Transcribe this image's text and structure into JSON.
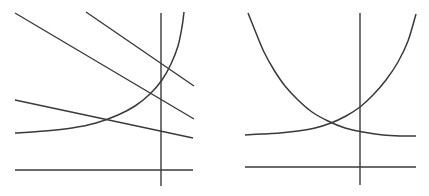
{
  "figure": {
    "title": "",
    "background_color": "#ffffff",
    "stroke_color": "#3a3a3a",
    "width": 429,
    "height": 196,
    "panel_count": 2
  },
  "chart_data": {
    "type": "line",
    "title": "",
    "subtitle": "",
    "xlabel": "",
    "ylabel": "",
    "grid": false,
    "legend": "none",
    "annotations": [],
    "panels": [
      {
        "name": "left-panel",
        "description": "Three downward-sloping straight lines crossed by a rising exponential curve, over an x-axis and a y-axis",
        "axes": {
          "x_axis": {
            "x1": 15,
            "y1": 170,
            "x2": 193,
            "y2": 170
          },
          "y_axis": {
            "x1": 161,
            "y1": 13,
            "x2": 161,
            "y2": 186
          }
        },
        "series": [
          {
            "name": "line-1",
            "kind": "straight-line",
            "points": [
              [
                15,
                13
              ],
              [
                194,
                119
              ]
            ]
          },
          {
            "name": "line-2",
            "kind": "straight-line",
            "points": [
              [
                86,
                12
              ],
              [
                194,
                86
              ]
            ]
          },
          {
            "name": "line-3",
            "kind": "straight-line",
            "points": [
              [
                15,
                100
              ],
              [
                193,
                138
              ]
            ]
          },
          {
            "name": "exponential-rising",
            "kind": "curve",
            "points": [
              [
                15,
                133
              ],
              [
                45,
                131
              ],
              [
                72,
                128
              ],
              [
                96,
                123
              ],
              [
                118,
                115
              ],
              [
                135,
                106
              ],
              [
                150,
                94
              ],
              [
                162,
                80
              ],
              [
                171,
                64
              ],
              [
                178,
                46
              ],
              [
                182,
                27
              ],
              [
                184,
                12
              ]
            ]
          }
        ]
      },
      {
        "name": "right-panel",
        "description": "A decaying exponential curve and a rising exponential curve crossing near the middle, over an x-axis and a y-axis",
        "axes": {
          "x_axis": {
            "x1": 245,
            "y1": 167,
            "x2": 416,
            "y2": 167
          },
          "y_axis": {
            "x1": 360,
            "y1": 13,
            "x2": 360,
            "y2": 185
          }
        },
        "series": [
          {
            "name": "exponential-decaying",
            "kind": "curve",
            "points": [
              [
                248,
                13
              ],
              [
                256,
                33
              ],
              [
                264,
                52
              ],
              [
                274,
                70
              ],
              [
                285,
                86
              ],
              [
                298,
                100
              ],
              [
                312,
                112
              ],
              [
                328,
                121
              ],
              [
                345,
                128
              ],
              [
                363,
                132
              ],
              [
                383,
                135
              ],
              [
                400,
                136
              ],
              [
                416,
                136
              ]
            ]
          },
          {
            "name": "exponential-rising",
            "kind": "curve",
            "points": [
              [
                245,
                135
              ],
              [
                262,
                134
              ],
              [
                280,
                133
              ],
              [
                298,
                131
              ],
              [
                315,
                128
              ],
              [
                331,
                123
              ],
              [
                346,
                116
              ],
              [
                360,
                107
              ],
              [
                373,
                95
              ],
              [
                386,
                80
              ],
              [
                398,
                62
              ],
              [
                408,
                41
              ],
              [
                416,
                14
              ]
            ]
          }
        ]
      }
    ]
  }
}
